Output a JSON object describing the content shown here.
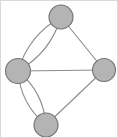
{
  "figure": {
    "width": 118,
    "height": 138,
    "background_color": "#ffffff",
    "border_color": "#d9d9d9"
  },
  "style": {
    "node_fill": "#b4b4b4",
    "node_stroke": "#737373",
    "edge_color": "#8c8c8c",
    "edge_width": 1.1,
    "node_radius": 12
  },
  "chart_data": {
    "type": "diagram",
    "diagram_kind": "graph",
    "node_count": 4,
    "edge_count": 7,
    "nodes": [
      {
        "id": "top",
        "label": "",
        "x": 60,
        "y": 16,
        "r": 12
      },
      {
        "id": "left",
        "label": "",
        "x": 17,
        "y": 70,
        "r": 12.5
      },
      {
        "id": "right",
        "label": "",
        "x": 103,
        "y": 69,
        "r": 11.5
      },
      {
        "id": "bottom",
        "label": "",
        "x": 45,
        "y": 124,
        "r": 12
      }
    ],
    "edges": [
      {
        "from": "top",
        "to": "left",
        "kind": "curved",
        "curvature": -14,
        "multiplicity_index": 1
      },
      {
        "from": "top",
        "to": "left",
        "kind": "curved",
        "curvature": 14,
        "multiplicity_index": 2
      },
      {
        "from": "left",
        "to": "bottom",
        "kind": "curved",
        "curvature": -13,
        "multiplicity_index": 1
      },
      {
        "from": "left",
        "to": "bottom",
        "kind": "curved",
        "curvature": 13,
        "multiplicity_index": 2
      },
      {
        "from": "top",
        "to": "right",
        "kind": "straight",
        "multiplicity_index": 1
      },
      {
        "from": "left",
        "to": "right",
        "kind": "straight",
        "multiplicity_index": 1
      },
      {
        "from": "right",
        "to": "bottom",
        "kind": "straight",
        "multiplicity_index": 1
      }
    ],
    "parallel_edge_pairs": [
      {
        "pair": "top-left",
        "count": 2
      },
      {
        "pair": "left-bottom",
        "count": 2
      }
    ],
    "degrees": {
      "top": 3,
      "left": 5,
      "right": 3,
      "bottom": 3
    }
  }
}
